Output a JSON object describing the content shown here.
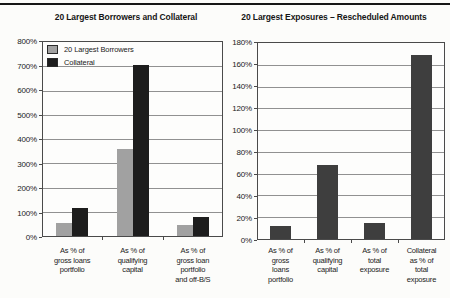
{
  "page": {
    "top_rule_color": "#161616",
    "background": "#fcfcfa"
  },
  "chart_data": [
    {
      "type": "bar",
      "title": "20 Largest Borrowers and Collateral",
      "categories": [
        [
          "As % of",
          "gross loans",
          "portfolio"
        ],
        [
          "As % of",
          "qualifying",
          "capital"
        ],
        [
          "As % of",
          "gross loan",
          "portfolio",
          "and off-B/S"
        ]
      ],
      "series": [
        {
          "name": "20 Largest Borrowers",
          "color": "#a1a1a1",
          "values": [
            55,
            355,
            45
          ]
        },
        {
          "name": "Collateral",
          "color": "#1d1d1d",
          "values": [
            115,
            700,
            80
          ]
        }
      ],
      "ylim": [
        0,
        800
      ],
      "ytick_step": 100,
      "ytick_suffix": "%",
      "grid": true,
      "legend_position": "top-left"
    },
    {
      "type": "bar",
      "title": "20 Largest Exposures – Rescheduled Amounts",
      "categories": [
        [
          "As % of",
          "gross",
          "loans",
          "portfolio"
        ],
        [
          "As % of",
          "qualifying",
          "capital"
        ],
        [
          "As % of",
          "total",
          "exposure"
        ],
        [
          "Collateral",
          "as % of",
          "total",
          "exposure"
        ]
      ],
      "series": [
        {
          "color": "#3e3e3e",
          "values": [
            12,
            68,
            15,
            168
          ]
        }
      ],
      "ylim": [
        0,
        180
      ],
      "ytick_step": 20,
      "ytick_suffix": "%",
      "grid": true,
      "legend_position": "none"
    }
  ]
}
